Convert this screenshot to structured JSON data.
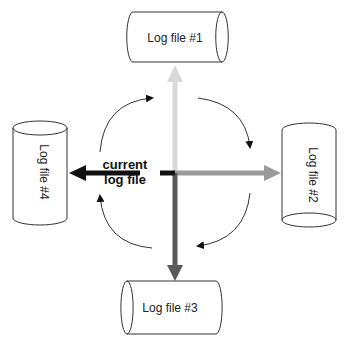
{
  "diagram": {
    "type": "log-file-rotation",
    "center_label": {
      "line1": "current",
      "line2": "log file"
    },
    "log_files": [
      {
        "label": "Log file #1",
        "position": "top",
        "arrow_color": "#d8d8d8"
      },
      {
        "label": "Log file #2",
        "position": "right",
        "arrow_color": "#9a9a9a"
      },
      {
        "label": "Log file #3",
        "position": "bottom",
        "arrow_color": "#5a5a5a"
      },
      {
        "label": "Log file #4",
        "position": "left",
        "arrow_color": "#111111"
      }
    ],
    "rotation_direction": "clockwise",
    "colors": {
      "stroke": "#333333",
      "background": "#ffffff"
    }
  }
}
